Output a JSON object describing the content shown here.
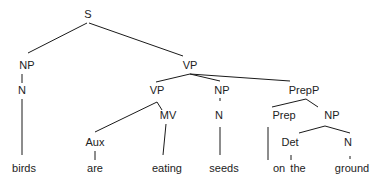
{
  "diagram": {
    "type": "syntax-tree",
    "sentence": "birds are eating seeds on the ground",
    "nodes": [
      {
        "id": "S",
        "label": "S",
        "x": 88,
        "y": 18
      },
      {
        "id": "NP1",
        "label": "NP",
        "x": 27,
        "y": 69
      },
      {
        "id": "N1",
        "label": "N",
        "x": 22,
        "y": 94
      },
      {
        "id": "VP1",
        "label": "VP",
        "x": 190,
        "y": 69
      },
      {
        "id": "VP2",
        "label": "VP",
        "x": 157,
        "y": 94
      },
      {
        "id": "NP2",
        "label": "NP",
        "x": 222,
        "y": 94
      },
      {
        "id": "PrepP",
        "label": "PrepP",
        "x": 304,
        "y": 94
      },
      {
        "id": "Aux",
        "label": "Aux",
        "x": 95,
        "y": 146
      },
      {
        "id": "MV",
        "label": "MV",
        "x": 168,
        "y": 119
      },
      {
        "id": "N2",
        "label": "N",
        "x": 219,
        "y": 119
      },
      {
        "id": "Prep",
        "label": "Prep",
        "x": 284,
        "y": 119
      },
      {
        "id": "NP3",
        "label": "NP",
        "x": 332,
        "y": 119
      },
      {
        "id": "Det",
        "label": "Det",
        "x": 290,
        "y": 146
      },
      {
        "id": "N3",
        "label": "N",
        "x": 348,
        "y": 146
      },
      {
        "id": "w_birds",
        "label": "birds",
        "x": 24,
        "y": 172
      },
      {
        "id": "w_are",
        "label": "are",
        "x": 95,
        "y": 172
      },
      {
        "id": "w_eating",
        "label": "eating",
        "x": 167,
        "y": 172
      },
      {
        "id": "w_seeds",
        "label": "seeds",
        "x": 224,
        "y": 172
      },
      {
        "id": "w_on",
        "label": "on",
        "x": 279,
        "y": 172
      },
      {
        "id": "w_the",
        "label": "the",
        "x": 298,
        "y": 172
      },
      {
        "id": "w_ground",
        "label": "ground",
        "x": 352,
        "y": 172
      }
    ],
    "edges": [
      {
        "x1": 87,
        "y1": 23,
        "x2": 28,
        "y2": 53
      },
      {
        "x1": 89,
        "y1": 23,
        "x2": 183,
        "y2": 56
      },
      {
        "x1": 22,
        "y1": 74,
        "x2": 22,
        "y2": 83
      },
      {
        "x1": 22,
        "y1": 99,
        "x2": 22,
        "y2": 155
      },
      {
        "x1": 190,
        "y1": 74,
        "x2": 156,
        "y2": 82
      },
      {
        "x1": 190,
        "y1": 74,
        "x2": 220,
        "y2": 81
      },
      {
        "x1": 190,
        "y1": 74,
        "x2": 290,
        "y2": 81
      },
      {
        "x1": 157,
        "y1": 102,
        "x2": 95,
        "y2": 132
      },
      {
        "x1": 157,
        "y1": 102,
        "x2": 162,
        "y2": 110
      },
      {
        "x1": 95,
        "y1": 151,
        "x2": 95,
        "y2": 160
      },
      {
        "x1": 166,
        "y1": 124,
        "x2": 163,
        "y2": 155
      },
      {
        "x1": 220,
        "y1": 98,
        "x2": 220,
        "y2": 101
      },
      {
        "x1": 220,
        "y1": 127,
        "x2": 220,
        "y2": 155
      },
      {
        "x1": 306,
        "y1": 99,
        "x2": 272,
        "y2": 107
      },
      {
        "x1": 306,
        "y1": 99,
        "x2": 318,
        "y2": 107
      },
      {
        "x1": 268,
        "y1": 127,
        "x2": 268,
        "y2": 160
      },
      {
        "x1": 325,
        "y1": 126,
        "x2": 299,
        "y2": 133
      },
      {
        "x1": 325,
        "y1": 126,
        "x2": 350,
        "y2": 133
      },
      {
        "x1": 291,
        "y1": 155,
        "x2": 291,
        "y2": 160
      },
      {
        "x1": 350,
        "y1": 156,
        "x2": 350,
        "y2": 159
      }
    ]
  }
}
